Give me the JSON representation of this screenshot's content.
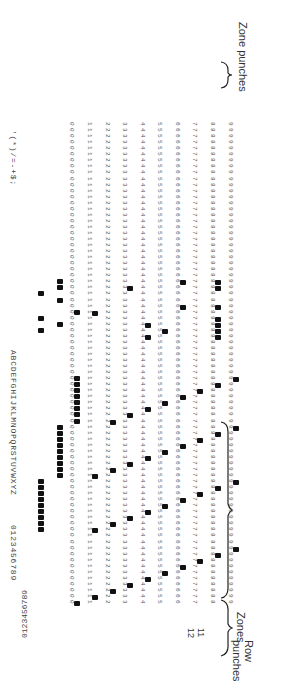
{
  "diagram": {
    "labels": {
      "zones": "Zones",
      "row_punches": "Row punches",
      "zone_punches": "Zone punches",
      "zone_12": "12",
      "zone_11": "11"
    },
    "printed_groups": {
      "digits": "0123456789",
      "letters": "ABCDEFGHIJKLMNOPQRSTUVWXYZ",
      "specials": "'(*)/=-+$;"
    },
    "row_digits": [
      "0",
      "1",
      "2",
      "3",
      "4",
      "5",
      "6",
      "7",
      "8",
      "9"
    ],
    "columns": 80,
    "colors": {
      "ink": "#111111",
      "text": "#444444",
      "paper": "#ffffff"
    }
  }
}
